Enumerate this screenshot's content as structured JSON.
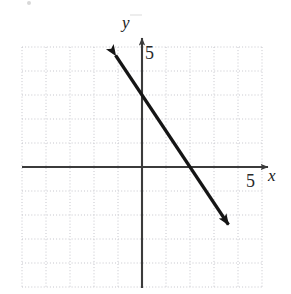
{
  "figure": {
    "type": "coordinate-graph",
    "background_color": "#ffffff",
    "grid": {
      "color": "#c9c9cf",
      "style": "dotted",
      "cell_px": 24,
      "x_min": -5,
      "x_max": 5,
      "y_min": -5,
      "y_max": 5,
      "visible": true
    },
    "axes": {
      "color": "#3b3b3b",
      "origin_px": {
        "x": 142,
        "y": 167
      },
      "x_label": "x",
      "y_label": "y",
      "x_tick_label": "5",
      "y_tick_label": "5",
      "x_tick_value": 5,
      "y_tick_value": 5,
      "arrowheads": "both-positive-ends"
    }
  },
  "chart_data": {
    "type": "line",
    "title": "",
    "xlabel": "x",
    "ylabel": "y",
    "xlim": [
      -5,
      5
    ],
    "ylim": [
      -5,
      5
    ],
    "grid": true,
    "legend": null,
    "series": [
      {
        "name": "line",
        "color": "#151515",
        "slope": -1.5,
        "y_intercept": 3,
        "x_intercept": 2,
        "equation": "y = -1.5x + 3",
        "arrow_both_ends": true,
        "x": [
          -1.1,
          3.6
        ],
        "y": [
          4.65,
          -2.4
        ],
        "points": [
          {
            "x": -1.1,
            "y": 4.65
          },
          {
            "x": 0,
            "y": 3
          },
          {
            "x": 2,
            "y": 0
          },
          {
            "x": 3.6,
            "y": -2.4
          }
        ]
      }
    ],
    "tick_labels": {
      "x": [
        "5"
      ],
      "y": [
        "5"
      ]
    }
  }
}
